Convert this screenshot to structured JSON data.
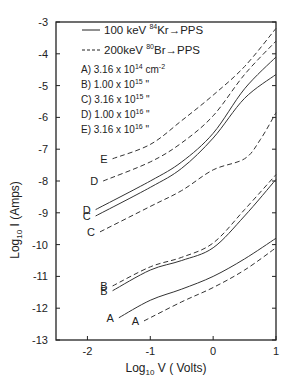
{
  "chart_data": {
    "type": "line",
    "title": "",
    "xlabel": "Log10 V (Volts)",
    "ylabel": "Log10 I (Amps)",
    "xlim": [
      -2.5,
      1
    ],
    "ylim": [
      -13,
      -3
    ],
    "x_ticks": [
      -2,
      -1,
      0,
      1
    ],
    "x_tick_labels": [
      "-2",
      "-1",
      "0",
      "1"
    ],
    "y_ticks": [
      -3,
      -4,
      -5,
      -6,
      -7,
      -8,
      -9,
      -10,
      -11,
      -12,
      -13
    ],
    "y_tick_labels": [
      "-3",
      "-4",
      "-5",
      "-6",
      "-7",
      "-8",
      "-9",
      "-10",
      "-11",
      "-12",
      "-13"
    ],
    "grid": false,
    "legend": {
      "position": "upper left",
      "entries": [
        {
          "style": "solid",
          "label": "100 keV 84Kr → PPS",
          "energy": "100 keV",
          "isotope_mass": "84",
          "ion": "Kr",
          "target": "PPS"
        },
        {
          "style": "dashed",
          "label": "200 keV 80Br → PPS",
          "energy": "200keV",
          "isotope_mass": "80",
          "ion": "Br",
          "target": "PPS"
        }
      ],
      "fluences": [
        {
          "key": "A",
          "text": "A) 3.16 x 10^14 cm^-2",
          "mantissa": "3.16",
          "exp": "14",
          "unit": "cm-2"
        },
        {
          "key": "B",
          "text": "B) 1.00 x 10^15 \"",
          "mantissa": "1.00",
          "exp": "15",
          "unit": "\""
        },
        {
          "key": "C",
          "text": "C) 3.16 x 10^15 \"",
          "mantissa": "3.16",
          "exp": "15",
          "unit": "\""
        },
        {
          "key": "D",
          "text": "D) 1.00 x 10^16 \"",
          "mantissa": "1.00",
          "exp": "16",
          "unit": "\""
        },
        {
          "key": "E",
          "text": "E) 3.16 x 10^16 \"",
          "mantissa": "3.16",
          "exp": "16",
          "unit": "\""
        }
      ]
    },
    "series": [
      {
        "name": "E (200keV Br)",
        "label": "E",
        "style": "dashed",
        "x": [
          -1.6,
          -1.0,
          -0.5,
          0.0,
          0.5,
          1.0
        ],
        "y": [
          -7.3,
          -6.85,
          -6.1,
          -5.3,
          -4.4,
          -3.2
        ]
      },
      {
        "name": "D (200keV Br)",
        "label": "D",
        "style": "dashed",
        "x": [
          -1.75,
          -1.0,
          -0.5,
          0.0,
          0.5,
          1.0
        ],
        "y": [
          -8.0,
          -7.4,
          -6.8,
          -5.95,
          -4.65,
          -3.6
        ]
      },
      {
        "name": "D (100keV Kr)",
        "label": "D",
        "style": "solid",
        "x": [
          -1.87,
          -1.0,
          -0.5,
          0.0,
          0.5,
          1.0
        ],
        "y": [
          -8.9,
          -8.0,
          -7.4,
          -6.5,
          -5.1,
          -4.1
        ]
      },
      {
        "name": "C (100keV Kr)",
        "label": "C",
        "style": "solid",
        "x": [
          -1.87,
          -1.0,
          -0.5,
          0.0,
          0.5,
          1.0
        ],
        "y": [
          -9.1,
          -8.2,
          -7.6,
          -6.65,
          -5.4,
          -4.65
        ]
      },
      {
        "name": "C (200keV Br)",
        "label": "C",
        "style": "dashed",
        "x": [
          -1.8,
          -1.0,
          -0.5,
          0.0,
          0.5,
          0.75,
          1.0
        ],
        "y": [
          -9.6,
          -8.8,
          -8.3,
          -7.65,
          -7.3,
          -6.7,
          -5.85
        ]
      },
      {
        "name": "B (200keV Br)",
        "label": "B",
        "style": "dashed",
        "x": [
          -1.6,
          -1.0,
          -0.5,
          0.0,
          0.5,
          1.0
        ],
        "y": [
          -11.3,
          -10.7,
          -10.4,
          -9.95,
          -8.9,
          -7.8
        ]
      },
      {
        "name": "B (100keV Kr)",
        "label": "B",
        "style": "solid",
        "x": [
          -1.6,
          -1.0,
          -0.5,
          0.0,
          0.5,
          1.0
        ],
        "y": [
          -11.45,
          -10.8,
          -10.5,
          -10.1,
          -9.1,
          -7.95
        ]
      },
      {
        "name": "A (100keV Kr)",
        "label": "A",
        "style": "solid",
        "x": [
          -1.5,
          -1.0,
          -0.5,
          0.0,
          0.5,
          1.0
        ],
        "y": [
          -12.3,
          -11.75,
          -11.4,
          -11.0,
          -10.45,
          -9.8
        ]
      },
      {
        "name": "A (200keV Br)",
        "label": "A",
        "style": "dashed",
        "x": [
          -1.1,
          -0.5,
          0.0,
          0.5,
          1.0
        ],
        "y": [
          -12.4,
          -11.8,
          -11.35,
          -10.8,
          -10.1
        ]
      }
    ]
  },
  "axes": {
    "x_title_main": "Log",
    "x_title_sub": "10",
    "x_title_rest": " V ( Volts)",
    "y_title_main": "Log",
    "y_title_sub": "10",
    "y_title_rest": " I (Amps)"
  }
}
